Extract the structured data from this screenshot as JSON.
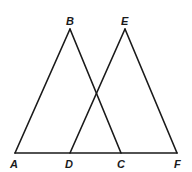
{
  "diagram": {
    "type": "geometry",
    "points": {
      "A": {
        "label": "A",
        "x": 15,
        "y": 153
      },
      "B": {
        "label": "B",
        "x": 70,
        "y": 29
      },
      "C": {
        "label": "C",
        "x": 121,
        "y": 153
      },
      "D": {
        "label": "D",
        "x": 70,
        "y": 153
      },
      "E": {
        "label": "E",
        "x": 125,
        "y": 29
      },
      "F": {
        "label": "F",
        "x": 177,
        "y": 153
      }
    },
    "segments": [
      {
        "name": "AB",
        "from": "A",
        "to": "B"
      },
      {
        "name": "BC",
        "from": "B",
        "to": "C"
      },
      {
        "name": "DE",
        "from": "D",
        "to": "E"
      },
      {
        "name": "EF",
        "from": "E",
        "to": "F"
      },
      {
        "name": "AF",
        "from": "A",
        "to": "F"
      }
    ],
    "triangles": [
      "ABC",
      "DEF"
    ],
    "colors": {
      "stroke": "#1a1a1a",
      "background": "#ffffff"
    }
  }
}
